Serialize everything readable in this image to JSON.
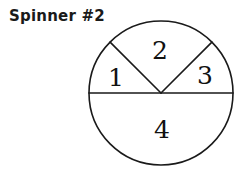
{
  "title": "Spinner #2",
  "colors": {
    "background": "#ffffff",
    "stroke": "#1a1a1a",
    "text": "#111111"
  },
  "spinner": {
    "center_x": 161,
    "center_y": 93,
    "radius": 72,
    "stroke_width": 1.6,
    "sectors": [
      {
        "label": "1",
        "start_angle_deg": 135,
        "end_angle_deg": 180,
        "label_x": 116,
        "label_y": 79
      },
      {
        "label": "2",
        "start_angle_deg": 45,
        "end_angle_deg": 135,
        "label_x": 160,
        "label_y": 52
      },
      {
        "label": "3",
        "start_angle_deg": 0,
        "end_angle_deg": 45,
        "label_x": 205,
        "label_y": 77
      },
      {
        "label": "4",
        "start_angle_deg": 180,
        "end_angle_deg": 360,
        "label_x": 162,
        "label_y": 131
      }
    ],
    "divider_lines": [
      {
        "name": "horizontal-diameter",
        "x1": 89,
        "y1": 93,
        "x2": 233,
        "y2": 93
      },
      {
        "name": "upper-left-radius",
        "x1": 161,
        "y1": 93,
        "x2": 110,
        "y2": 42
      },
      {
        "name": "upper-right-radius",
        "x1": 161,
        "y1": 93,
        "x2": 212,
        "y2": 42
      }
    ]
  }
}
